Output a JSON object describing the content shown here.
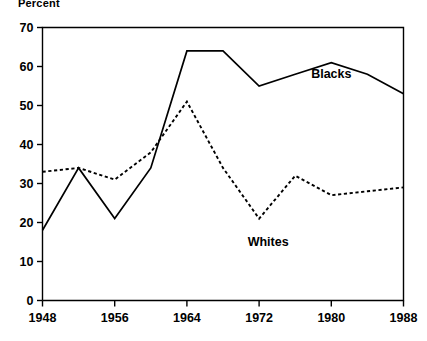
{
  "chart_data": {
    "type": "line",
    "title": "",
    "ylabel": "Percent",
    "xlabel": "",
    "x": [
      1948,
      1952,
      1956,
      1960,
      1964,
      1968,
      1972,
      1976,
      1980,
      1984,
      1988
    ],
    "xlim": [
      1948,
      1988
    ],
    "ylim": [
      0,
      70
    ],
    "xticks": [
      1948,
      1956,
      1964,
      1972,
      1980,
      1988
    ],
    "yticks": [
      0,
      10,
      20,
      30,
      40,
      50,
      60,
      70
    ],
    "xtick_labels": [
      "1948",
      "1956",
      "1964",
      "1972",
      "1980",
      "1988"
    ],
    "ytick_labels": [
      "0",
      "10",
      "20",
      "30",
      "40",
      "50",
      "60",
      "70"
    ],
    "grid": false,
    "legend_position": "inline-annotation",
    "series": [
      {
        "name": "Blacks",
        "style": "solid",
        "color": "#000000",
        "label_x": 1980,
        "label_y": 57,
        "values": [
          18,
          34,
          21,
          34,
          64,
          64,
          55,
          58,
          61,
          58,
          53
        ]
      },
      {
        "name": "Whites",
        "style": "dashed",
        "color": "#000000",
        "label_x": 1973,
        "label_y": 14,
        "values": [
          33,
          34,
          31,
          38,
          51,
          34,
          21,
          32,
          27,
          28,
          29
        ]
      }
    ],
    "annotations": [
      {
        "text": "Blacks",
        "x": 1980,
        "y": 57
      },
      {
        "text": "Whites",
        "x": 1973,
        "y": 14
      }
    ]
  }
}
